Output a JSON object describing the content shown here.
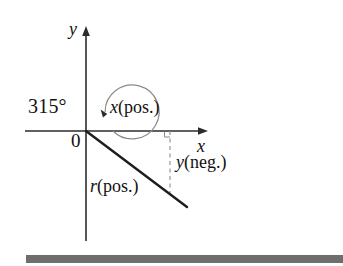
{
  "figure": {
    "kind": "math-diagram",
    "background_color": "#ffffff",
    "ink_color": "#111111",
    "axes": {
      "x_axis_label": "x",
      "y_axis_label": "y",
      "origin_label": "0",
      "x_axis": {
        "x_start": 25,
        "x_end": 207,
        "y": 131,
        "arrow": "right"
      },
      "y_axis": {
        "x": 86,
        "y_start": 27,
        "y_end": 241,
        "arrow": "up"
      }
    },
    "angle": {
      "value_label": "315°",
      "degrees": 315,
      "direction": "counterclockwise",
      "arc_radius": 27,
      "arc_center": {
        "x": 86,
        "y": 131
      },
      "arc_color": "#7a7a7a",
      "arrow_at_end": true
    },
    "terminal_ray": {
      "label_text": "r",
      "label_sign": "(pos.)",
      "from": {
        "x": 86,
        "y": 131
      },
      "to": {
        "x": 187,
        "y": 207
      },
      "stroke_width": 2.4
    },
    "components": {
      "x_component": {
        "text": "x",
        "sign": "(pos.)"
      },
      "y_component": {
        "text": "y",
        "sign": "(neg.)"
      },
      "r_component": {
        "text": "r",
        "sign": "(pos.)"
      }
    },
    "drop_line": {
      "style": "dashed",
      "x": 170,
      "y_top": 131,
      "y_bottom": 197,
      "color": "#8d8d8d",
      "right_angle_marker": true
    },
    "bottom_rule": {
      "color": "#6e6e6e",
      "left": 26,
      "top": 255,
      "width": 317,
      "height": 8
    }
  }
}
